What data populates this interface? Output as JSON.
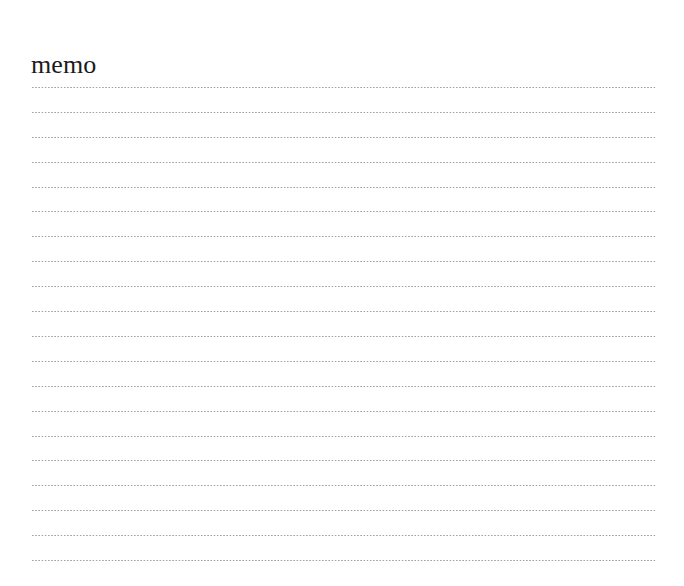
{
  "document": {
    "title": "memo",
    "page_width": 684,
    "page_height": 586,
    "background_color": "#ffffff",
    "title_color": "#1a1a1a"
  },
  "ruled_sheet": {
    "line_style": "dotted",
    "line_color": "#9a9a9e",
    "line_count": 20,
    "line_left": 32,
    "line_right": 656,
    "line_spacing": 24.9,
    "first_line_y": 88,
    "lines": [
      {
        "index": 1,
        "text": ""
      },
      {
        "index": 2,
        "text": ""
      },
      {
        "index": 3,
        "text": ""
      },
      {
        "index": 4,
        "text": ""
      },
      {
        "index": 5,
        "text": ""
      },
      {
        "index": 6,
        "text": ""
      },
      {
        "index": 7,
        "text": ""
      },
      {
        "index": 8,
        "text": ""
      },
      {
        "index": 9,
        "text": ""
      },
      {
        "index": 10,
        "text": ""
      },
      {
        "index": 11,
        "text": ""
      },
      {
        "index": 12,
        "text": ""
      },
      {
        "index": 13,
        "text": ""
      },
      {
        "index": 14,
        "text": ""
      },
      {
        "index": 15,
        "text": ""
      },
      {
        "index": 16,
        "text": ""
      },
      {
        "index": 17,
        "text": ""
      },
      {
        "index": 18,
        "text": ""
      },
      {
        "index": 19,
        "text": ""
      },
      {
        "index": 20,
        "text": ""
      }
    ]
  }
}
